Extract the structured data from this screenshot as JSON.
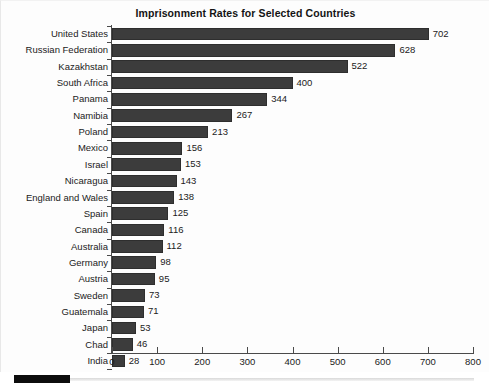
{
  "chart_data": {
    "type": "bar",
    "orientation": "horizontal",
    "title": "Imprisonment Rates for Selected Countries",
    "xlabel": "",
    "ylabel": "",
    "xlim": [
      0,
      800
    ],
    "grid": false,
    "legend": null,
    "bar_color": "#3c3c3c",
    "xticks": [
      0,
      100,
      200,
      300,
      400,
      500,
      600,
      700,
      800
    ],
    "xtick_labels": [
      "0",
      "100",
      "200",
      "300",
      "400",
      "500",
      "600",
      "700",
      "800"
    ],
    "categories": [
      "United States",
      "Russian Federation",
      "Kazakhstan",
      "South Africa",
      "Panama",
      "Namibia",
      "Poland",
      "Mexico",
      "Israel",
      "Nicaragua",
      "England and Wales",
      "Spain",
      "Canada",
      "Australia",
      "Germany",
      "Austria",
      "Sweden",
      "Guatemala",
      "Japan",
      "Chad",
      "India"
    ],
    "values": [
      702,
      628,
      522,
      400,
      344,
      267,
      213,
      156,
      153,
      143,
      138,
      125,
      116,
      112,
      98,
      95,
      73,
      71,
      53,
      46,
      28
    ],
    "data_labels": [
      "702",
      "628",
      "522",
      "400",
      "344",
      "267",
      "213",
      "156",
      "153",
      "143",
      "138",
      "125",
      "116",
      "112",
      "98",
      "95",
      "73",
      "71",
      "53",
      "46",
      "28"
    ]
  },
  "scrollbar": {
    "orientation": "horizontal",
    "thumb_position": "left"
  }
}
